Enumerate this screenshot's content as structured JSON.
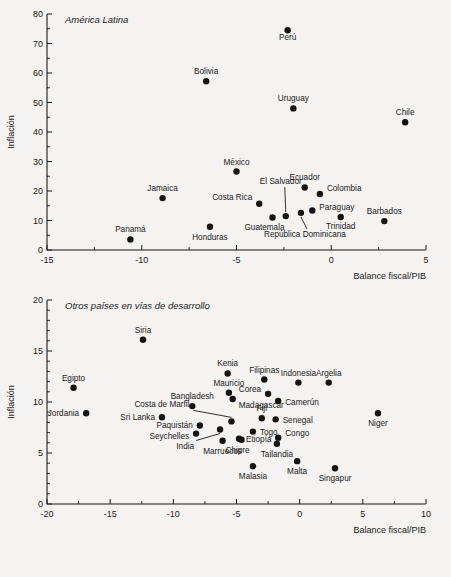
{
  "figure": {
    "background_color": "#f4f3f1",
    "marker_color": "#141414",
    "axis_color": "#1a1a1a"
  },
  "chart_data": [
    {
      "type": "scatter",
      "title": "América Latina",
      "xlabel": "Balance fiscal/PIB",
      "ylabel": "Inflación",
      "xlim": [
        -15,
        5
      ],
      "ylim": [
        0,
        80
      ],
      "xticks": [
        -15,
        -10,
        -5,
        0,
        5
      ],
      "yticks": [
        0,
        10,
        20,
        30,
        40,
        50,
        60,
        70,
        80
      ],
      "x_minor_step": 2.5,
      "y_minor_step": 5,
      "grid": false,
      "legend": "none",
      "points": [
        {
          "label": "Perú",
          "x": -2.3,
          "y": 74.5,
          "label_dx": 0,
          "label_dy": 10,
          "anchor": "middle"
        },
        {
          "label": "Bolivia",
          "x": -6.6,
          "y": 57.2,
          "label_dx": 0,
          "label_dy": -7,
          "anchor": "middle"
        },
        {
          "label": "Uruguay",
          "x": -2.0,
          "y": 48.0,
          "label_dx": 0,
          "label_dy": -7,
          "anchor": "middle"
        },
        {
          "label": "Chile",
          "x": 3.9,
          "y": 43.3,
          "label_dx": 0,
          "label_dy": -7,
          "anchor": "middle"
        },
        {
          "label": "México",
          "x": -5.0,
          "y": 26.6,
          "label_dx": 0,
          "label_dy": -7,
          "anchor": "middle"
        },
        {
          "label": "Ecuador",
          "x": -1.4,
          "y": 21.2,
          "label_dx": 0,
          "label_dy": -7,
          "anchor": "middle"
        },
        {
          "label": "Colombia",
          "x": -0.6,
          "y": 19.0,
          "label_dx": 7,
          "label_dy": -3,
          "anchor": "start"
        },
        {
          "label": "Jamaica",
          "x": -8.9,
          "y": 17.6,
          "label_dx": 0,
          "label_dy": -7,
          "anchor": "middle"
        },
        {
          "label": "Costa Rica",
          "x": -3.8,
          "y": 15.7,
          "label_dx": -7,
          "label_dy": -4,
          "anchor": "end"
        },
        {
          "label": "Paraguay",
          "x": -1.0,
          "y": 13.4,
          "label_dx": 7,
          "label_dy": 0,
          "anchor": "start"
        },
        {
          "label": "El Salvador",
          "x": -2.4,
          "y": 11.5,
          "label_dx": -5,
          "label_dy": -32,
          "anchor": "middle",
          "leader": true
        },
        {
          "label": "República Dominicana",
          "x": -1.6,
          "y": 12.6,
          "label_dx": 4,
          "label_dy": 24,
          "anchor": "middle",
          "leader": true
        },
        {
          "label": "Trinidad",
          "x": 0.5,
          "y": 11.2,
          "label_dx": 0,
          "label_dy": 12,
          "anchor": "middle"
        },
        {
          "label": "Barbados",
          "x": 2.8,
          "y": 9.8,
          "label_dx": 0,
          "label_dy": -7,
          "anchor": "middle"
        },
        {
          "label": "Guatemala",
          "x": -3.1,
          "y": 11.0,
          "label_dx": -8,
          "label_dy": 12,
          "anchor": "middle"
        },
        {
          "label": "Honduras",
          "x": -6.4,
          "y": 7.9,
          "label_dx": 0,
          "label_dy": 13,
          "anchor": "middle"
        },
        {
          "label": "Panamá",
          "x": -10.6,
          "y": 3.6,
          "label_dx": 0,
          "label_dy": -7,
          "anchor": "middle"
        }
      ]
    },
    {
      "type": "scatter",
      "title": "Otros países en vías de desarrollo",
      "xlabel": "Balance fiscal/PIB",
      "ylabel": "Inflación",
      "xlim": [
        -20,
        10
      ],
      "ylim": [
        0,
        20
      ],
      "xticks": [
        -20,
        -15,
        -10,
        -5,
        0,
        5,
        10
      ],
      "yticks": [
        0,
        5,
        10,
        15,
        20
      ],
      "x_minor_step": 2.5,
      "y_minor_step": 1,
      "grid": false,
      "legend": "none",
      "points": [
        {
          "label": "Siria",
          "x": -12.4,
          "y": 16.1,
          "label_dx": 0,
          "label_dy": -7,
          "anchor": "middle"
        },
        {
          "label": "Kenia",
          "x": -5.7,
          "y": 12.8,
          "label_dx": 0,
          "label_dy": -7,
          "anchor": "middle"
        },
        {
          "label": "Filipinas",
          "x": -2.8,
          "y": 12.2,
          "label_dx": 0,
          "label_dy": -7,
          "anchor": "middle"
        },
        {
          "label": "Indonesia",
          "x": -0.1,
          "y": 11.9,
          "label_dx": 0,
          "label_dy": -7,
          "anchor": "middle"
        },
        {
          "label": "Argelia",
          "x": 2.3,
          "y": 11.9,
          "label_dx": 0,
          "label_dy": -7,
          "anchor": "middle"
        },
        {
          "label": "Egipto",
          "x": -17.9,
          "y": 11.4,
          "label_dx": 0,
          "label_dy": -7,
          "anchor": "middle"
        },
        {
          "label": "Mauricio",
          "x": -5.6,
          "y": 10.9,
          "label_dx": 0,
          "label_dy": -7,
          "anchor": "middle"
        },
        {
          "label": "Corea",
          "x": -2.5,
          "y": 10.8,
          "label_dx": -7,
          "label_dy": -2,
          "anchor": "end"
        },
        {
          "label": "Camerún",
          "x": -1.7,
          "y": 10.1,
          "label_dx": 7,
          "label_dy": 4,
          "anchor": "start"
        },
        {
          "label": "Bangladesh",
          "x": -8.5,
          "y": 9.6,
          "label_dx": 0,
          "label_dy": -7,
          "anchor": "middle"
        },
        {
          "label": "Madagascar",
          "x": -5.3,
          "y": 10.3,
          "label_dx": 6,
          "label_dy": 9,
          "anchor": "start"
        },
        {
          "label": "Jordania",
          "x": -16.9,
          "y": 8.9,
          "label_dx": -7,
          "label_dy": 3,
          "anchor": "end"
        },
        {
          "label": "Niger",
          "x": 6.2,
          "y": 8.9,
          "label_dx": 0,
          "label_dy": 13,
          "anchor": "middle"
        },
        {
          "label": "Fiji",
          "x": -3.0,
          "y": 8.4,
          "label_dx": 0,
          "label_dy": -7,
          "anchor": "middle"
        },
        {
          "label": "Senegal",
          "x": -1.9,
          "y": 8.3,
          "label_dx": 7,
          "label_dy": 4,
          "anchor": "start"
        },
        {
          "label": "Sri Lanka",
          "x": -10.9,
          "y": 8.5,
          "label_dx": -7,
          "label_dy": 3,
          "anchor": "end"
        },
        {
          "label": "Costa de Marfil",
          "x": -5.4,
          "y": 8.1,
          "label_dx": -42,
          "label_dy": -14,
          "anchor": "end",
          "leader": true
        },
        {
          "label": "Paquistán",
          "x": -7.9,
          "y": 7.7,
          "label_dx": -7,
          "label_dy": 3,
          "anchor": "end"
        },
        {
          "label": "Seychelles",
          "x": -8.2,
          "y": 6.9,
          "label_dx": -7,
          "label_dy": 5,
          "anchor": "end"
        },
        {
          "label": "Togo",
          "x": -3.7,
          "y": 7.1,
          "label_dx": 7,
          "label_dy": 3,
          "anchor": "start"
        },
        {
          "label": "Congo",
          "x": -1.7,
          "y": 6.5,
          "label_dx": 7,
          "label_dy": -2,
          "anchor": "start"
        },
        {
          "label": "India",
          "x": -6.3,
          "y": 7.3,
          "label_dx": -26,
          "label_dy": 19,
          "anchor": "end",
          "leader": true
        },
        {
          "label": "Etiopía",
          "x": -4.8,
          "y": 6.4,
          "label_dx": 7,
          "label_dy": 3,
          "anchor": "start"
        },
        {
          "label": "Marruecos",
          "x": -6.1,
          "y": 6.2,
          "label_dx": 0,
          "label_dy": 13,
          "anchor": "middle"
        },
        {
          "label": "Chipre",
          "x": -4.6,
          "y": 6.3,
          "label_dx": -4,
          "label_dy": 13,
          "anchor": "middle"
        },
        {
          "label": "Tailandia",
          "x": -1.8,
          "y": 5.9,
          "label_dx": 0,
          "label_dy": 13,
          "anchor": "middle"
        },
        {
          "label": "Malta",
          "x": -0.2,
          "y": 4.2,
          "label_dx": 0,
          "label_dy": 13,
          "anchor": "middle"
        },
        {
          "label": "Malasia",
          "x": -3.7,
          "y": 3.7,
          "label_dx": 0,
          "label_dy": 13,
          "anchor": "middle"
        },
        {
          "label": "Singapur",
          "x": 2.8,
          "y": 3.5,
          "label_dx": 0,
          "label_dy": 13,
          "anchor": "middle"
        }
      ]
    }
  ]
}
